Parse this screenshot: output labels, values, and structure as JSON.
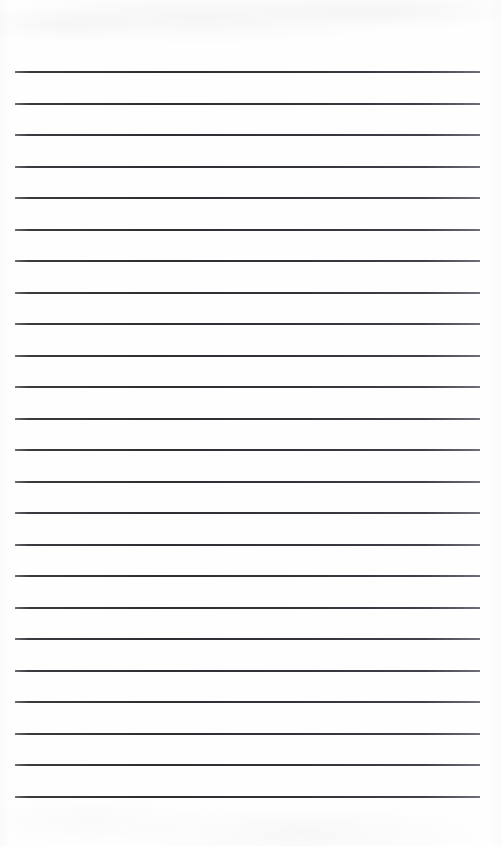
{
  "document": {
    "type": "lined-paper",
    "title": "Blank Lined Notepad Page",
    "page_width": 501,
    "page_height": 846,
    "background_color": "#fefefe",
    "has_text_content": false,
    "notes_text": ""
  },
  "ruling": {
    "line_color": "#31313a",
    "line_thickness_px": 2,
    "line_count": 24,
    "left_margin_px": 15,
    "right_margin_px": 21,
    "line_length_px": 465,
    "first_line_y_px": 72,
    "line_spacing_px": 31.5,
    "last_line_y_px": 796.5,
    "orientation": "horizontal",
    "line_y_positions": [
      72,
      103.5,
      135,
      166.5,
      198,
      229.5,
      261,
      292.5,
      324,
      355.5,
      387,
      418.5,
      450,
      481.5,
      513,
      544.5,
      576,
      607.5,
      639,
      670.5,
      702,
      733.5,
      765,
      796.5
    ]
  },
  "margins": {
    "top_blank_px": 72,
    "bottom_blank_px": 49
  }
}
